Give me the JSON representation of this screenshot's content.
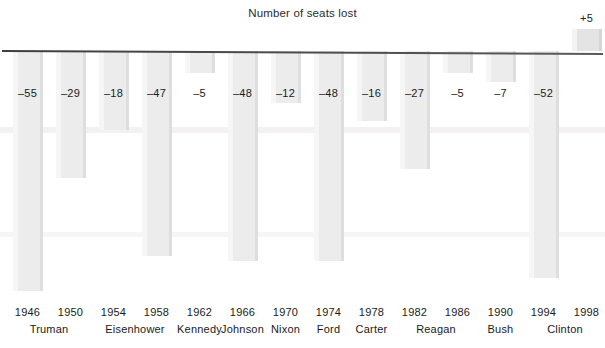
{
  "chart_data": {
    "type": "bar",
    "title": "Number of seats lost",
    "subtitle": "",
    "xlabel": "",
    "ylabel": "",
    "grid": false,
    "legend": "none",
    "orientation": "vertical",
    "baseline": 0,
    "ylim": [
      -60,
      10
    ],
    "categories": [
      "1946",
      "1950",
      "1954",
      "1958",
      "1962",
      "1966",
      "1970",
      "1974",
      "1978",
      "1982",
      "1986",
      "1990",
      "1994",
      "1998"
    ],
    "values": [
      -55,
      -29,
      -18,
      -47,
      -5,
      -48,
      -12,
      -48,
      -16,
      -27,
      -5,
      -7,
      -52,
      5
    ],
    "data_labels": [
      "–55",
      "–29",
      "–18",
      "–47",
      "–5",
      "–48",
      "–12",
      "–48",
      "–16",
      "–27",
      "–5",
      "–7",
      "–52",
      "+5"
    ],
    "group_labels": [
      "Truman",
      "Eisenhower",
      "Kennedy",
      "Johnson",
      "Nixon",
      "Ford",
      "Carter",
      "Reagan",
      "Bush",
      "Clinton"
    ],
    "bars": [
      {
        "year": "1946",
        "value": -55,
        "label": "–55",
        "president": "Truman"
      },
      {
        "year": "1950",
        "value": -29,
        "label": "–29",
        "president": "Truman"
      },
      {
        "year": "1954",
        "value": -18,
        "label": "–18",
        "president": "Eisenhower"
      },
      {
        "year": "1958",
        "value": -47,
        "label": "–47",
        "president": "Eisenhower"
      },
      {
        "year": "1962",
        "value": -5,
        "label": "–5",
        "president": "Kennedy"
      },
      {
        "year": "1966",
        "value": -48,
        "label": "–48",
        "president": "Johnson"
      },
      {
        "year": "1970",
        "value": -12,
        "label": "–12",
        "president": "Nixon"
      },
      {
        "year": "1974",
        "value": -48,
        "label": "–48",
        "president": "Ford"
      },
      {
        "year": "1978",
        "value": -16,
        "label": "–16",
        "president": "Carter"
      },
      {
        "year": "1982",
        "value": -27,
        "label": "–27",
        "president": "Reagan"
      },
      {
        "year": "1986",
        "value": -5,
        "label": "–5",
        "president": "Reagan"
      },
      {
        "year": "1990",
        "value": -7,
        "label": "–7",
        "president": "Bush"
      },
      {
        "year": "1994",
        "value": -52,
        "label": "–52",
        "president": "Clinton"
      },
      {
        "year": "1998",
        "value": 5,
        "label": "+5",
        "president": "Clinton"
      }
    ],
    "presidents": [
      {
        "name": "Truman",
        "center_year_index": 0.5
      },
      {
        "name": "Eisenhower",
        "center_year_index": 2.5
      },
      {
        "name": "Kennedy",
        "center_year_index": 4.0
      },
      {
        "name": "Johnson",
        "center_year_index": 5.0
      },
      {
        "name": "Nixon",
        "center_year_index": 6.0
      },
      {
        "name": "Ford",
        "center_year_index": 7.0
      },
      {
        "name": "Carter",
        "center_year_index": 8.0
      },
      {
        "name": "Reagan",
        "center_year_index": 9.5
      },
      {
        "name": "Bush",
        "center_year_index": 11.0
      },
      {
        "name": "Clinton",
        "center_year_index": 12.5
      }
    ],
    "colors": {
      "bar_fill": "#ececec",
      "bar_edge": "#dedede",
      "axis_line": "#4a4a4a",
      "text": "#1a1a1a",
      "background": "#ffffff"
    }
  }
}
